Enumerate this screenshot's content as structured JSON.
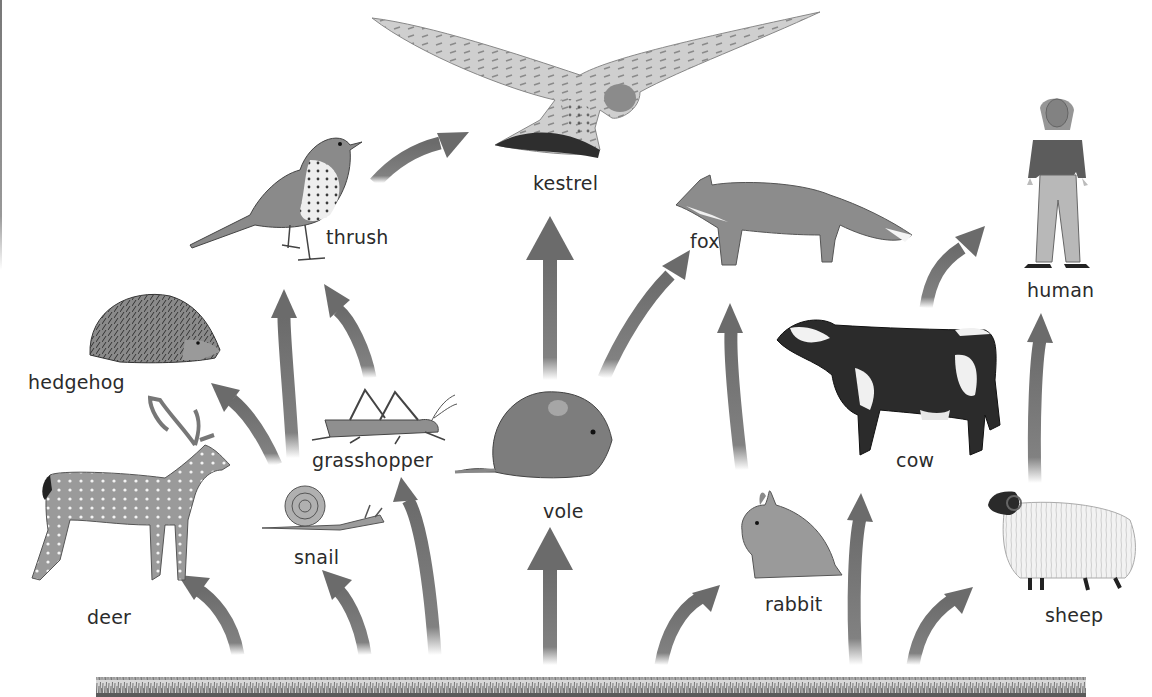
{
  "diagram": {
    "type": "food-web",
    "arrow_color": "#6b6b6b",
    "grass_color": "#7a7a7a",
    "organisms": [
      {
        "id": "kestrel",
        "label": "kestrel",
        "x": 533,
        "y": 174
      },
      {
        "id": "thrush",
        "label": "thrush",
        "x": 326,
        "y": 228
      },
      {
        "id": "fox",
        "label": "fox",
        "x": 690,
        "y": 232
      },
      {
        "id": "human",
        "label": "human",
        "x": 1027,
        "y": 281
      },
      {
        "id": "hedgehog",
        "label": "hedgehog",
        "x": 28,
        "y": 373
      },
      {
        "id": "grasshopper",
        "label": "grasshopper",
        "x": 312,
        "y": 451
      },
      {
        "id": "cow",
        "label": "cow",
        "x": 896,
        "y": 451
      },
      {
        "id": "deer",
        "label": "deer",
        "x": 87,
        "y": 608
      },
      {
        "id": "snail",
        "label": "snail",
        "x": 294,
        "y": 548
      },
      {
        "id": "vole",
        "label": "vole",
        "x": 543,
        "y": 502
      },
      {
        "id": "rabbit",
        "label": "rabbit",
        "x": 765,
        "y": 595
      },
      {
        "id": "sheep",
        "label": "sheep",
        "x": 1045,
        "y": 606
      }
    ],
    "producer": {
      "id": "grass",
      "label": ""
    },
    "links": [
      {
        "from": "grass",
        "to": "deer"
      },
      {
        "from": "grass",
        "to": "snail"
      },
      {
        "from": "grass",
        "to": "grasshopper"
      },
      {
        "from": "grass",
        "to": "vole"
      },
      {
        "from": "grass",
        "to": "rabbit"
      },
      {
        "from": "grass",
        "to": "cow"
      },
      {
        "from": "grass",
        "to": "sheep"
      },
      {
        "from": "snail",
        "to": "hedgehog"
      },
      {
        "from": "snail",
        "to": "thrush"
      },
      {
        "from": "grasshopper",
        "to": "thrush"
      },
      {
        "from": "thrush",
        "to": "kestrel"
      },
      {
        "from": "vole",
        "to": "kestrel"
      },
      {
        "from": "vole",
        "to": "fox"
      },
      {
        "from": "rabbit",
        "to": "fox"
      },
      {
        "from": "cow",
        "to": "human"
      },
      {
        "from": "sheep",
        "to": "human"
      }
    ]
  }
}
